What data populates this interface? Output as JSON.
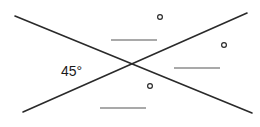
{
  "diagram": {
    "type": "intersecting-lines-angle-problem",
    "colors": {
      "line": "#2a2a2a",
      "blank": "#555555",
      "background": "#ffffff"
    },
    "lines": [
      {
        "id": "line-a",
        "x1": 15,
        "y1": 16,
        "x2": 252,
        "y2": 113
      },
      {
        "id": "line-b",
        "x1": 23,
        "y1": 112,
        "x2": 247,
        "y2": 13
      }
    ],
    "given_angle": {
      "value": "45°",
      "x": 61,
      "y": 64
    },
    "unknown_angles": [
      {
        "id": "top",
        "blank": {
          "x1": 111,
          "x2": 157,
          "y": 40
        },
        "degree": {
          "cx": 160,
          "cy": 17
        }
      },
      {
        "id": "right",
        "blank": {
          "x1": 174,
          "x2": 220,
          "y": 68
        },
        "degree": {
          "cx": 224,
          "cy": 45
        }
      },
      {
        "id": "bottom",
        "blank": {
          "x1": 100,
          "x2": 146,
          "y": 108
        },
        "degree": {
          "cx": 150,
          "cy": 86
        }
      }
    ]
  }
}
